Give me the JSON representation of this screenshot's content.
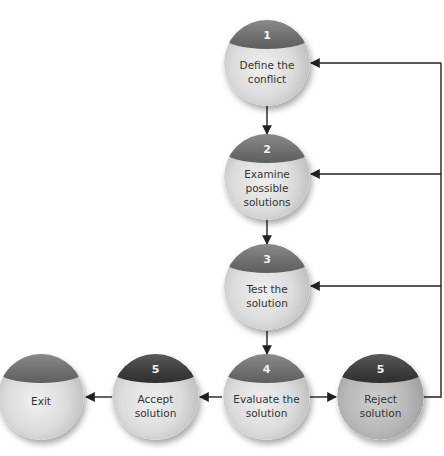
{
  "diagram": {
    "type": "flowchart",
    "colors": {
      "line": "#222222",
      "cap": "#6e6e6e",
      "cap_dark": "#3d3d3d",
      "body": "#dcdcdc",
      "label": "#333333"
    },
    "nodes": [
      {
        "id": "define",
        "number": "1",
        "label": "Define the\nconflict"
      },
      {
        "id": "examine",
        "number": "2",
        "label": "Examine\npossible\nsolutions"
      },
      {
        "id": "test",
        "number": "3",
        "label": "Test the\nsolution"
      },
      {
        "id": "evaluate",
        "number": "4",
        "label": "Evaluate the\nsolution"
      },
      {
        "id": "accept",
        "number": "5",
        "label": "Accept\nsolution"
      },
      {
        "id": "reject",
        "number": "5",
        "label": "Reject\nsolution"
      },
      {
        "id": "exit",
        "number": "",
        "label": "Exit"
      }
    ],
    "edges": [
      {
        "from": "define",
        "to": "examine"
      },
      {
        "from": "examine",
        "to": "test"
      },
      {
        "from": "test",
        "to": "evaluate"
      },
      {
        "from": "evaluate",
        "to": "accept"
      },
      {
        "from": "accept",
        "to": "exit"
      },
      {
        "from": "evaluate",
        "to": "reject"
      },
      {
        "from": "reject",
        "to": "define"
      },
      {
        "from": "reject",
        "to": "examine"
      },
      {
        "from": "reject",
        "to": "test"
      }
    ]
  }
}
